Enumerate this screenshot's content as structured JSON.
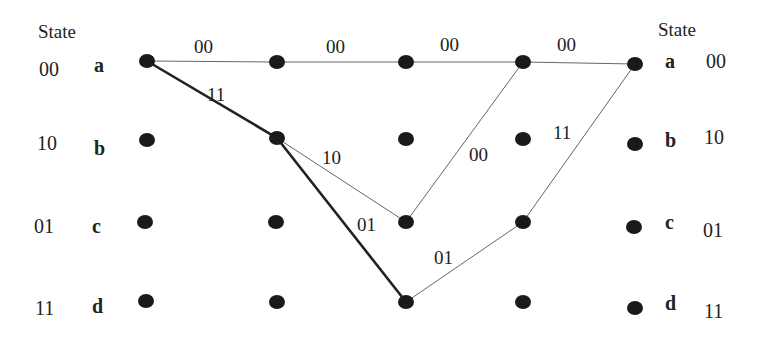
{
  "diagram": {
    "type": "trellis",
    "left_header": "State",
    "right_header": "State",
    "states": [
      {
        "letter": "a",
        "code": "00"
      },
      {
        "letter": "b",
        "code": "10"
      },
      {
        "letter": "c",
        "code": "01"
      },
      {
        "letter": "d",
        "code": "11"
      }
    ],
    "columns": 5,
    "edges": [
      {
        "from": [
          0,
          "a"
        ],
        "to": [
          1,
          "a"
        ],
        "label": "00",
        "highlight": false
      },
      {
        "from": [
          1,
          "a"
        ],
        "to": [
          2,
          "a"
        ],
        "label": "00",
        "highlight": false
      },
      {
        "from": [
          2,
          "a"
        ],
        "to": [
          3,
          "a"
        ],
        "label": "00",
        "highlight": false
      },
      {
        "from": [
          3,
          "a"
        ],
        "to": [
          4,
          "a"
        ],
        "label": "00",
        "highlight": false
      },
      {
        "from": [
          0,
          "a"
        ],
        "to": [
          1,
          "b"
        ],
        "label": "11",
        "highlight": true
      },
      {
        "from": [
          1,
          "b"
        ],
        "to": [
          2,
          "c"
        ],
        "label": "10",
        "highlight": false
      },
      {
        "from": [
          1,
          "b"
        ],
        "to": [
          2,
          "d"
        ],
        "label": "01",
        "highlight": true
      },
      {
        "from": [
          2,
          "c"
        ],
        "to": [
          3,
          "a"
        ],
        "label": "00",
        "highlight": false
      },
      {
        "from": [
          2,
          "d"
        ],
        "to": [
          3,
          "c"
        ],
        "label": "01",
        "highlight": false
      },
      {
        "from": [
          3,
          "c"
        ],
        "to": [
          4,
          "a"
        ],
        "label": "11",
        "highlight": false
      }
    ]
  },
  "labels": {
    "left_state": "State",
    "right_state": "State",
    "left_codes": [
      "00",
      "10",
      "01",
      "11"
    ],
    "left_letters": [
      "a",
      "b",
      "c",
      "d"
    ],
    "right_letters": [
      "a",
      "b",
      "c",
      "d"
    ],
    "right_codes": [
      "00",
      "10",
      "01",
      "11"
    ],
    "edge_labels": {
      "a0_a1": "00",
      "a1_a2": "00",
      "a2_a3": "00",
      "a3_a4": "00",
      "a0_b1": "11",
      "b1_c2": "10",
      "b1_d2": "01",
      "c2_a3": "00",
      "d2_c3": "01",
      "c3_a4": "11"
    }
  }
}
